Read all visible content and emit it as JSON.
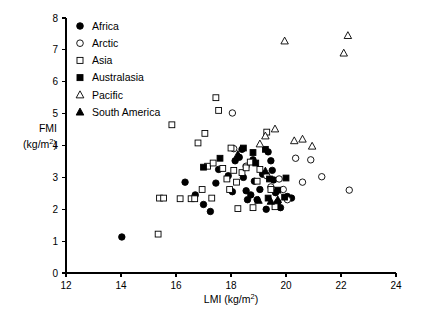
{
  "chart_data": {
    "type": "scatter",
    "title": "",
    "xlabel": "LMI (kg/m2)",
    "ylabel": "FMI (kg/m2)",
    "xlim": [
      12,
      24
    ],
    "ylim": [
      0,
      8
    ],
    "xticks": [
      12,
      14,
      16,
      18,
      20,
      22,
      24
    ],
    "yticks": [
      0,
      1,
      2,
      3,
      4,
      5,
      6,
      7,
      8
    ],
    "grid": false,
    "legend_position": "top-left inside",
    "series": [
      {
        "name": "Africa",
        "marker": "filled-circle",
        "color": "#000000",
        "points": [
          [
            14.03,
            1.13
          ],
          [
            16.33,
            2.85
          ],
          [
            16.7,
            2.45
          ],
          [
            17.0,
            2.15
          ],
          [
            17.25,
            1.93
          ],
          [
            17.45,
            2.82
          ],
          [
            17.55,
            3.25
          ],
          [
            17.9,
            3.05
          ],
          [
            18.05,
            2.55
          ],
          [
            18.15,
            3.52
          ],
          [
            18.3,
            3.63
          ],
          [
            18.45,
            3.0
          ],
          [
            18.55,
            2.58
          ],
          [
            18.6,
            2.3
          ],
          [
            18.72,
            2.45
          ],
          [
            18.8,
            3.55
          ],
          [
            18.85,
            2.88
          ],
          [
            18.95,
            2.3
          ],
          [
            19.05,
            2.62
          ],
          [
            19.15,
            3.1
          ],
          [
            19.35,
            3.8
          ],
          [
            19.45,
            3.52
          ],
          [
            19.5,
            3.22
          ],
          [
            19.55,
            2.92
          ],
          [
            19.62,
            2.52
          ],
          [
            19.7,
            2.22
          ],
          [
            19.8,
            2.05
          ],
          [
            20.05,
            2.4
          ],
          [
            20.2,
            2.35
          ],
          [
            18.4,
            3.88
          ],
          [
            19.28,
            2.0
          ]
        ]
      },
      {
        "name": "Arctic",
        "marker": "open-circle",
        "color": "#000000",
        "points": [
          [
            18.05,
            5.02
          ],
          [
            18.1,
            3.9
          ],
          [
            18.55,
            3.35
          ],
          [
            19.3,
            3.05
          ],
          [
            19.45,
            2.7
          ],
          [
            19.9,
            2.62
          ],
          [
            20.05,
            2.3
          ],
          [
            20.35,
            3.6
          ],
          [
            20.9,
            3.55
          ],
          [
            21.3,
            3.02
          ],
          [
            20.6,
            2.85
          ],
          [
            22.3,
            2.6
          ],
          [
            19.75,
            2.95
          ]
        ]
      },
      {
        "name": "Asia",
        "marker": "open-square",
        "color": "#000000",
        "points": [
          [
            15.35,
            1.22
          ],
          [
            15.4,
            2.35
          ],
          [
            15.55,
            2.35
          ],
          [
            15.85,
            4.65
          ],
          [
            16.15,
            2.33
          ],
          [
            16.55,
            2.33
          ],
          [
            16.68,
            2.33
          ],
          [
            16.8,
            4.08
          ],
          [
            17.05,
            4.38
          ],
          [
            17.15,
            3.35
          ],
          [
            17.35,
            3.45
          ],
          [
            17.45,
            5.5
          ],
          [
            17.55,
            5.1
          ],
          [
            17.7,
            3.28
          ],
          [
            17.85,
            2.95
          ],
          [
            17.95,
            2.62
          ],
          [
            18.0,
            3.92
          ],
          [
            18.1,
            3.22
          ],
          [
            18.2,
            2.85
          ],
          [
            18.25,
            2.02
          ],
          [
            18.4,
            3.15
          ],
          [
            18.55,
            3.3
          ],
          [
            18.7,
            3.48
          ],
          [
            18.8,
            2.05
          ],
          [
            18.95,
            2.88
          ],
          [
            19.05,
            3.25
          ],
          [
            19.3,
            4.42
          ],
          [
            19.45,
            2.62
          ],
          [
            19.6,
            2.08
          ],
          [
            16.95,
            2.62
          ],
          [
            17.3,
            2.35
          ]
        ]
      },
      {
        "name": "Australasia",
        "marker": "filled-square",
        "color": "#000000",
        "points": [
          [
            17.0,
            3.32
          ],
          [
            17.6,
            3.6
          ],
          [
            18.45,
            3.92
          ],
          [
            18.8,
            3.78
          ],
          [
            19.25,
            3.88
          ],
          [
            19.4,
            2.95
          ],
          [
            19.7,
            2.6
          ],
          [
            20.0,
            2.98
          ],
          [
            19.95,
            2.38
          ],
          [
            18.9,
            3.45
          ],
          [
            19.35,
            2.35
          ]
        ]
      },
      {
        "name": "Pacific",
        "marker": "open-triangle",
        "color": "#000000",
        "points": [
          [
            19.95,
            7.28
          ],
          [
            22.25,
            7.45
          ],
          [
            22.1,
            6.9
          ],
          [
            19.6,
            4.52
          ],
          [
            20.3,
            4.15
          ],
          [
            20.6,
            4.2
          ],
          [
            20.95,
            3.98
          ],
          [
            19.25,
            4.3
          ],
          [
            19.05,
            4.05
          ]
        ]
      },
      {
        "name": "South America",
        "marker": "filled-triangle",
        "color": "#000000",
        "points": [
          [
            18.25,
            3.72
          ],
          [
            19.0,
            2.28
          ],
          [
            19.45,
            2.25
          ],
          [
            19.7,
            2.3
          ],
          [
            19.25,
            3.2
          ]
        ]
      }
    ]
  },
  "legend": {
    "items": [
      {
        "label": "Africa",
        "marker": "filled-circle"
      },
      {
        "label": "Arctic",
        "marker": "open-circle"
      },
      {
        "label": "Asia",
        "marker": "open-square"
      },
      {
        "label": "Australasia",
        "marker": "filled-square"
      },
      {
        "label": "Pacific",
        "marker": "open-triangle"
      },
      {
        "label": "South America",
        "marker": "filled-triangle"
      }
    ]
  },
  "axis": {
    "y_label_line1": "FMI",
    "y_label_line2_pre": "(kg/m",
    "y_label_line2_sup": "2",
    "y_label_line2_post": ")",
    "x_label_pre": "LMI (kg/m",
    "x_label_sup": "2",
    "x_label_post": ")"
  }
}
